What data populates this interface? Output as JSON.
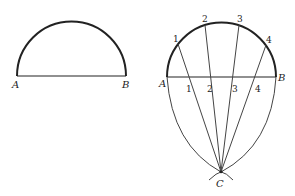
{
  "figure_left": {
    "label_a": "A",
    "label_b": "B"
  },
  "figure_right": {
    "label_a": "A",
    "label_b": "B",
    "label_c": "C",
    "arc_points": [
      "1",
      "2",
      "3",
      "4"
    ],
    "diameter_points": [
      "1",
      "2",
      "3",
      "4"
    ]
  },
  "colors": {
    "stroke": "#222222",
    "background": "#ffffff"
  }
}
